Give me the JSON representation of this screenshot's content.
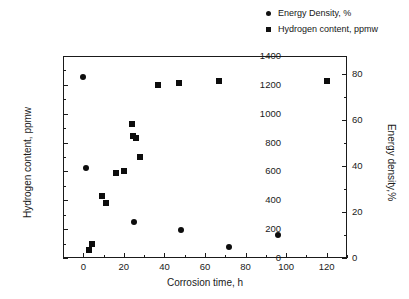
{
  "chart_data": {
    "type": "scatter",
    "title": "",
    "xlabel": "Corrosion time, h",
    "ylabel": "Hydrogen content, ppmw",
    "y2label": "Energy density,%",
    "xlim": [
      -10,
      130
    ],
    "ylim": [
      0,
      1400
    ],
    "y2lim": [
      0,
      88
    ],
    "xticks": [
      0,
      20,
      40,
      60,
      80,
      100,
      120
    ],
    "yticks": [
      0,
      200,
      400,
      600,
      800,
      1000,
      1200,
      1400
    ],
    "y2ticks": [
      0,
      20,
      40,
      60,
      80
    ],
    "grid": false,
    "legend_position": "top-right",
    "series": [
      {
        "name": "Energy Density, %",
        "marker": "circle",
        "axis": "right",
        "color": "#0d0d0d",
        "points": [
          {
            "x": 0,
            "y2": 79.0,
            "y": 1235
          },
          {
            "x": 1.5,
            "y2": 39.0,
            "y": 568
          },
          {
            "x": 25,
            "y2": 15.5,
            "y": 238
          },
          {
            "x": 48,
            "y2": 12.0,
            "y": 186
          },
          {
            "x": 72,
            "y2": 4.6,
            "y": 70
          },
          {
            "x": 96,
            "y2": 10.0,
            "y": 152
          }
        ]
      },
      {
        "name": "Hydrogen content, ppmw",
        "marker": "square",
        "axis": "left",
        "color": "#0d0d0d",
        "points": [
          {
            "x": 3,
            "y": 55
          },
          {
            "x": 4.5,
            "y": 100
          },
          {
            "x": 9,
            "y": 433
          },
          {
            "x": 11,
            "y": 378
          },
          {
            "x": 16,
            "y": 590
          },
          {
            "x": 20,
            "y": 600
          },
          {
            "x": 24,
            "y": 930
          },
          {
            "x": 24.5,
            "y": 845
          },
          {
            "x": 26,
            "y": 835
          },
          {
            "x": 28,
            "y": 700
          },
          {
            "x": 37,
            "y": 1200
          },
          {
            "x": 47,
            "y": 1210
          },
          {
            "x": 67,
            "y": 1230
          },
          {
            "x": 120,
            "y": 1228
          }
        ]
      }
    ]
  },
  "legend": {
    "items": [
      {
        "label": "Energy Density, %",
        "marker": "circle"
      },
      {
        "label": "Hydrogen content, ppmw",
        "marker": "square"
      }
    ]
  },
  "colors": {
    "marker": "#0d0d0d",
    "axis": "#1a1a1a",
    "background": "#ffffff"
  }
}
